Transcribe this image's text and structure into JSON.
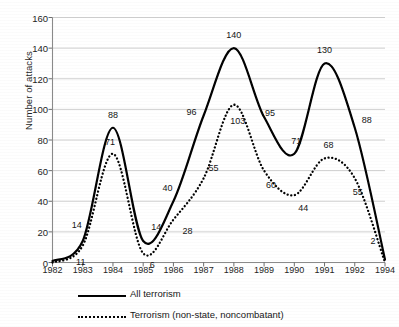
{
  "chart_data": {
    "type": "line",
    "title": "",
    "xlabel": "",
    "ylabel": "Number of attacks",
    "x": [
      1982,
      1983,
      1984,
      1985,
      1986,
      1987,
      1988,
      1989,
      1990,
      1991,
      1992,
      1994
    ],
    "xtick_labels": [
      "1982",
      "1983",
      "1984",
      "1985",
      "1986",
      "1987",
      "1988",
      "1989",
      "1990",
      "1991",
      "1992",
      "1994"
    ],
    "ytick_labels": [
      "0",
      "20",
      "40",
      "60",
      "80",
      "100",
      "120",
      "140",
      "160"
    ],
    "ytick_values": [
      0,
      20,
      40,
      60,
      80,
      100,
      120,
      140,
      160
    ],
    "ylim": [
      0,
      160
    ],
    "grid": true,
    "legend_position": "bottom",
    "series": [
      {
        "name": "All terrorism",
        "style": "solid",
        "color": "#000000",
        "values": [
          1,
          14,
          88,
          14,
          40,
          96,
          140,
          95,
          71,
          130,
          88,
          2
        ],
        "point_labels": [
          "",
          "14",
          "88",
          "14",
          "40",
          "96",
          "140",
          "95",
          "71",
          "130",
          "88",
          "2"
        ]
      },
      {
        "name": "Terrorism (non-state, noncombatant)",
        "style": "dotted",
        "color": "#000000",
        "values": [
          0,
          11,
          71,
          6,
          28,
          55,
          103,
          60,
          44,
          68,
          55,
          0
        ],
        "point_labels": [
          "",
          "11",
          "71",
          "6",
          "28",
          "55",
          "103",
          "60",
          "44",
          "68",
          "55",
          ""
        ]
      }
    ],
    "annotations": [
      {
        "text": "14",
        "x": 1983,
        "y": 14,
        "dx": -6,
        "dy": -16
      },
      {
        "text": "11",
        "x": 1983,
        "y": 11,
        "dx": -2,
        "dy": 16
      },
      {
        "text": "88",
        "x": 1984,
        "y": 88,
        "dx": 0,
        "dy": -13
      },
      {
        "text": "71",
        "x": 1984,
        "y": 71,
        "dx": -3,
        "dy": -12
      },
      {
        "text": "14",
        "x": 1985,
        "y": 14,
        "dx": 13,
        "dy": -14
      },
      {
        "text": "6",
        "x": 1985,
        "y": 6,
        "dx": 9,
        "dy": 12
      },
      {
        "text": "40",
        "x": 1986,
        "y": 40,
        "dx": -6,
        "dy": -13
      },
      {
        "text": "28",
        "x": 1986,
        "y": 28,
        "dx": 14,
        "dy": 11
      },
      {
        "text": "96",
        "x": 1987,
        "y": 96,
        "dx": -12,
        "dy": -4
      },
      {
        "text": "55",
        "x": 1987,
        "y": 55,
        "dx": 10,
        "dy": -10
      },
      {
        "text": "140",
        "x": 1988,
        "y": 140,
        "dx": 0,
        "dy": -13
      },
      {
        "text": "103",
        "x": 1988,
        "y": 103,
        "dx": 4,
        "dy": 16
      },
      {
        "text": "95",
        "x": 1989,
        "y": 95,
        "dx": 6,
        "dy": -4
      },
      {
        "text": "60",
        "x": 1989,
        "y": 60,
        "dx": 7,
        "dy": 14
      },
      {
        "text": "71",
        "x": 1990,
        "y": 71,
        "dx": 2,
        "dy": -13
      },
      {
        "text": "44",
        "x": 1990,
        "y": 44,
        "dx": 9,
        "dy": 13
      },
      {
        "text": "130",
        "x": 1991,
        "y": 130,
        "dx": 0,
        "dy": -13
      },
      {
        "text": "68",
        "x": 1991,
        "y": 68,
        "dx": 4,
        "dy": -13
      },
      {
        "text": "88",
        "x": 1992,
        "y": 88,
        "dx": 12,
        "dy": -8
      },
      {
        "text": "55",
        "x": 1992,
        "y": 55,
        "dx": 3,
        "dy": 14
      },
      {
        "text": "2",
        "x": 1994,
        "y": 2,
        "dx": -12,
        "dy": -18
      }
    ]
  },
  "legend": {
    "items": [
      {
        "label": "All terrorism",
        "style": "solid"
      },
      {
        "label": "Terrorism (non-state, noncombatant)",
        "style": "dotted"
      }
    ]
  },
  "axes": {
    "y_title": "Number of attacks"
  }
}
